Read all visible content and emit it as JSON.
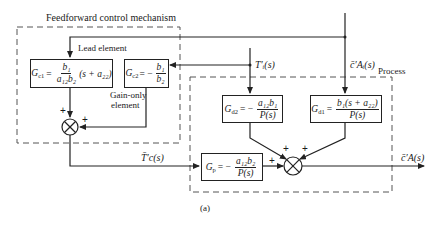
{
  "figure": {
    "caption": "(a)",
    "groups": {
      "feedforward": {
        "label": "Feedforward control mechanism"
      },
      "process": {
        "label": "Process"
      }
    },
    "annotations": {
      "lead_element": "Lead element",
      "gain_only_line1": "Gain-only",
      "gain_only_line2": "element"
    },
    "blocks": {
      "gc1": {
        "name": "G",
        "sub": "c1",
        "eq": "=",
        "num": "b₁",
        "den": "a₁₂b₂",
        "tail": "(s + a₂₂)"
      },
      "gc2": {
        "name": "G",
        "sub": "c2",
        "eq": "= −",
        "num": "b₁",
        "den": "b₂"
      },
      "gd2": {
        "name": "G",
        "sub": "d2",
        "eq": "= −",
        "num": "a₁₂b₁",
        "den": "P(s)"
      },
      "gd1": {
        "name": "G",
        "sub": "d1",
        "eq": "=",
        "num": "b₁(s + a₂₂)",
        "den": "P(s)"
      },
      "gp": {
        "name": "G",
        "sub": "p",
        "eq": "= −",
        "num": "a₁₂b₂",
        "den": "P(s)"
      }
    },
    "signals": {
      "tl": "T′ᵢ(s)",
      "ca": "c̄′Aᵢ(s)",
      "tc": "T̄′c(s)",
      "out": "c̄′A(s)"
    },
    "summing_junctions": {
      "sum1": {
        "signs": [
          "+",
          "+"
        ]
      },
      "sum2": {
        "signs": [
          "+",
          "+",
          "+"
        ]
      }
    }
  }
}
